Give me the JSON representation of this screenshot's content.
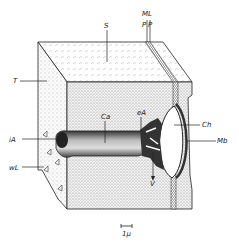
{
  "diagram": {
    "type": "block-section",
    "labels": {
      "S": "S",
      "ML": "ML",
      "P1": "P",
      "P2": "P",
      "T": "T",
      "Ca": "Ca",
      "eA": "eA",
      "iA": "iA",
      "Ch": "Ch",
      "Mb": "Mb",
      "wL": "wL",
      "V": "V"
    },
    "scale_bar": {
      "label": "1µ"
    },
    "colors": {
      "ink": "#222222",
      "paper": "#ffffff",
      "stipple": "#bbbbbb"
    }
  }
}
